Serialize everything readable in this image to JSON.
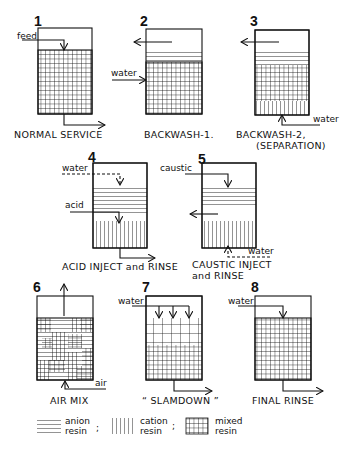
{
  "figure": {
    "steps": [
      {
        "number": "1",
        "caption": "NORMAL SERVICE",
        "labels": [
          "feed"
        ]
      },
      {
        "number": "2",
        "caption": "BACKWASH-1.",
        "labels": [
          "water"
        ]
      },
      {
        "number": "3",
        "caption": "BACKWASH-2,",
        "caption2": "(SEPARATION)",
        "labels": [
          "water"
        ]
      },
      {
        "number": "4",
        "caption": "ACID INJECT and RINSE",
        "labels": [
          "water",
          "acid"
        ]
      },
      {
        "number": "5",
        "caption": "CAUSTIC INJECT",
        "caption2": "and  RINSE",
        "labels": [
          "caustic",
          "water"
        ]
      },
      {
        "number": "6",
        "caption": "AIR  MIX",
        "labels": [
          "air"
        ]
      },
      {
        "number": "7",
        "caption": "“ SLAMDOWN ”",
        "labels": [
          "water"
        ]
      },
      {
        "number": "8",
        "caption": "FINAL  RINSE",
        "labels": [
          "water"
        ]
      }
    ],
    "legend": [
      {
        "pattern": "horizontal-lines",
        "line1": "anion",
        "line2": "resin",
        "sep": ";"
      },
      {
        "pattern": "vertical-lines",
        "line1": "cation",
        "line2": "resin",
        "sep": ";"
      },
      {
        "pattern": "grid",
        "line1": "mixed",
        "line2": "resin",
        "sep": ""
      }
    ]
  }
}
